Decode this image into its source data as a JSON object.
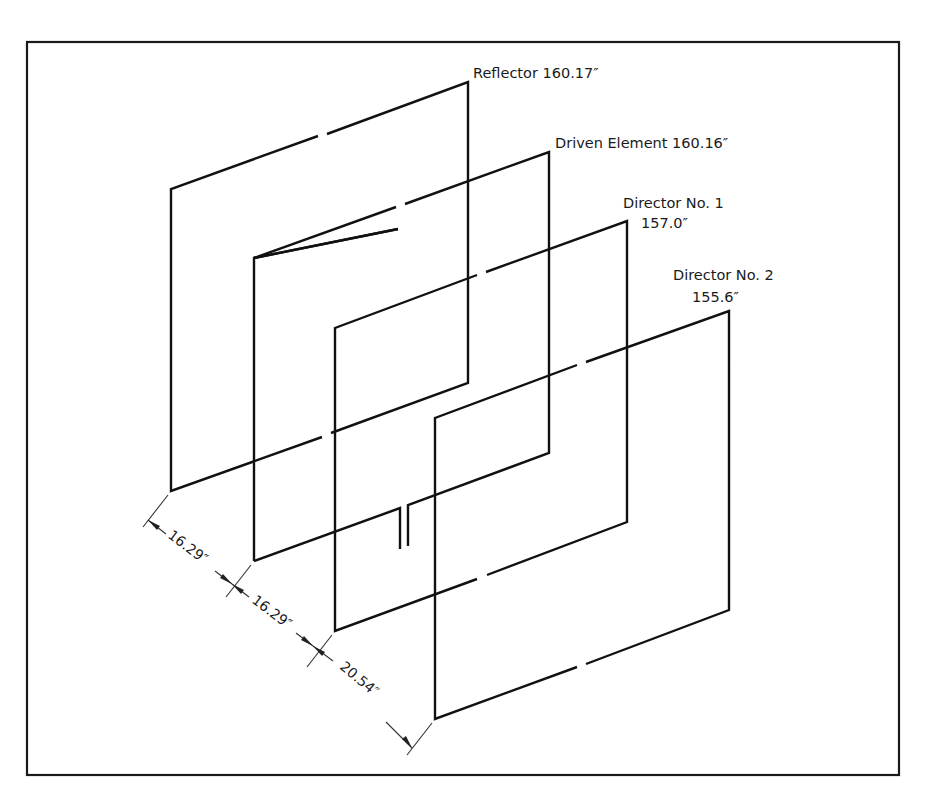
{
  "diagram": {
    "elements": [
      {
        "name": "Reflector",
        "label_line1": "Reflector 160.17″",
        "label_line2": ""
      },
      {
        "name": "Driven Element",
        "label_line1": "Driven Element 160.16″",
        "label_line2": ""
      },
      {
        "name": "Director No. 1",
        "label_line1": "Director No. 1",
        "label_line2": "157.0″"
      },
      {
        "name": "Director No. 2",
        "label_line1": "Director No. 2",
        "label_line2": "155.6″"
      }
    ],
    "spacings": [
      {
        "between": "Reflector – Driven Element",
        "label": "16.29″"
      },
      {
        "between": "Driven Element – Director No. 1",
        "label": "16.29″"
      },
      {
        "between": "Director No. 1 – Director No. 2",
        "label": "20.54″"
      }
    ],
    "line_color": "#111111",
    "background": "#ffffff"
  }
}
